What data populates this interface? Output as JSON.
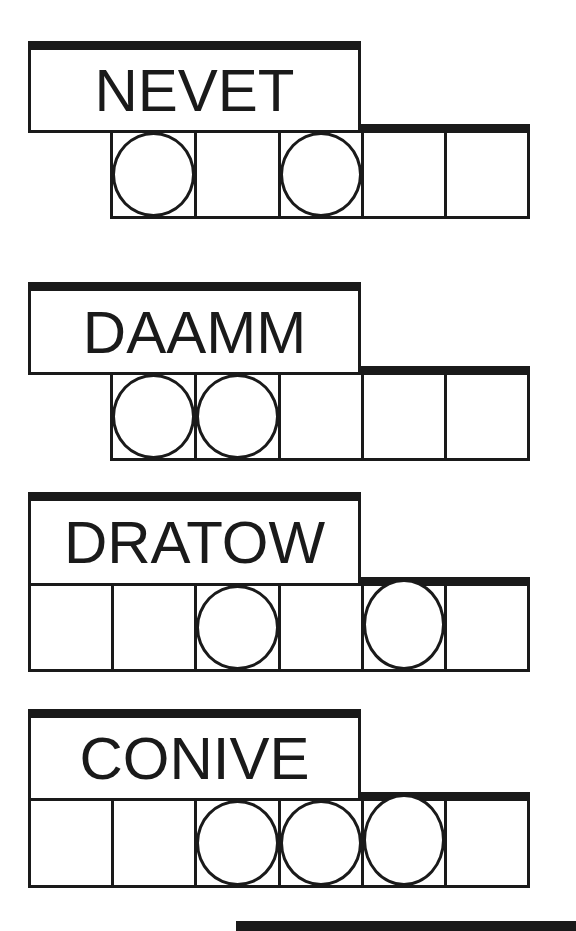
{
  "puzzle_title": "",
  "colors": {
    "ink": "#1a1a1a",
    "paper": "#ffffff"
  },
  "puzzles": [
    {
      "scrambled": "NEVET",
      "letters": 5,
      "circled_positions": [
        1,
        3
      ],
      "answer_cells": [
        "",
        "",
        "",
        "",
        ""
      ]
    },
    {
      "scrambled": "DAAMM",
      "letters": 5,
      "circled_positions": [
        1,
        2
      ],
      "answer_cells": [
        "",
        "",
        "",
        "",
        ""
      ]
    },
    {
      "scrambled": "DRATOW",
      "letters": 6,
      "circled_positions": [
        3,
        5
      ],
      "answer_cells": [
        "",
        "",
        "",
        "",
        "",
        ""
      ]
    },
    {
      "scrambled": "CONIVE",
      "letters": 6,
      "circled_positions": [
        3,
        4,
        5
      ],
      "answer_cells": [
        "",
        "",
        "",
        "",
        "",
        ""
      ]
    }
  ]
}
